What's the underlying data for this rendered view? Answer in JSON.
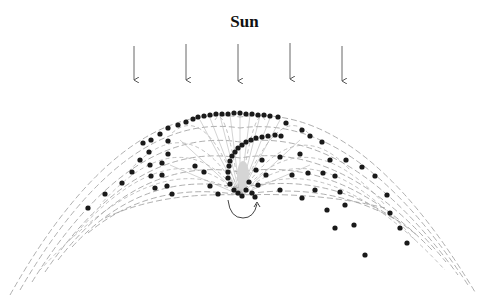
{
  "title": "Sun",
  "arrows": {
    "count": 5,
    "x": [
      134,
      186,
      238,
      290,
      342
    ],
    "y_start": 44,
    "y_end": 82,
    "color": "#555555"
  },
  "colors": {
    "dot": "#1a1a1a",
    "grid": "#9a9a9a",
    "background": "#ffffff"
  },
  "rotation_indicator": "curved-arrow",
  "footer_text_cropped": "…ents with bright spot of highest density of high…"
}
